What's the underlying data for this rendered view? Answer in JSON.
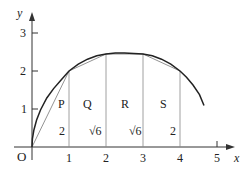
{
  "diagram": {
    "axes": {
      "x_label": "x",
      "y_label": "y",
      "origin_label": "O",
      "x_ticks": [
        "1",
        "2",
        "3",
        "4",
        "5"
      ],
      "y_ticks": [
        "1",
        "2",
        "3"
      ]
    },
    "curve": {
      "description": "y = sqrt(5x - x^2)",
      "points": [
        [
          1,
          2
        ],
        [
          2,
          2.449
        ],
        [
          3,
          2.449
        ],
        [
          4,
          2
        ]
      ]
    },
    "regions": [
      {
        "label": "P",
        "width_label": "2"
      },
      {
        "label": "Q",
        "width_label": "√6"
      },
      {
        "label": "R",
        "width_label": "√6"
      },
      {
        "label": "S",
        "width_label": "2"
      }
    ],
    "colors": {
      "curve": "#222222",
      "chords": "#777777",
      "axes": "#333333"
    }
  }
}
